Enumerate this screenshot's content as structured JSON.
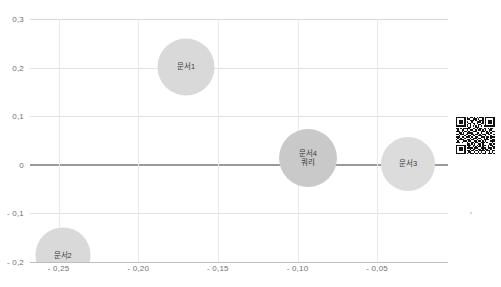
{
  "chart_data": {
    "type": "scatter",
    "title": "",
    "subtitle": "",
    "xlabel": "",
    "ylabel": "",
    "xlim": [
      -0.268,
      -0.0055
    ],
    "ylim": [
      -0.2,
      0.3
    ],
    "grid": true,
    "legend": "none",
    "decimal_separator": ",",
    "x_ticks": [
      {
        "value": -0.25,
        "label": "- 0,25"
      },
      {
        "value": -0.2,
        "label": "- 0,20"
      },
      {
        "value": -0.15,
        "label": "- 0,15"
      },
      {
        "value": -0.1,
        "label": "- 0,10"
      },
      {
        "value": -0.05,
        "label": "- 0,05"
      }
    ],
    "y_ticks": [
      {
        "value": 0.3,
        "label": "0,3"
      },
      {
        "value": 0.2,
        "label": "0,2"
      },
      {
        "value": 0.1,
        "label": "0,1"
      },
      {
        "value": 0.0,
        "label": "0"
      },
      {
        "value": -0.1,
        "label": "- 0,1"
      },
      {
        "value": -0.2,
        "label": "- 0,2"
      }
    ],
    "points": [
      {
        "label": "문서1",
        "label_lines": [
          "문서1"
        ],
        "x": -0.17,
        "y": 0.202,
        "size_px": 57,
        "color": "#d9d9d9"
      },
      {
        "label": "문서2",
        "label_lines": [
          "문서2"
        ],
        "x": -0.2475,
        "y": -0.185,
        "size_px": 55,
        "color": "#d9d9d9"
      },
      {
        "label": "문서4 쿼리",
        "label_lines": [
          "문서4",
          "쿼리"
        ],
        "x": -0.0935,
        "y": 0.014,
        "size_px": 58,
        "color": "#c9c9c9"
      },
      {
        "label": "문서3",
        "label_lines": [
          "문서3"
        ],
        "x": -0.0305,
        "y": 0.0015,
        "size_px": 54,
        "color": "#dcdcdc"
      }
    ]
  },
  "colors": {
    "background": "#ffffff",
    "grid": "#e3e3e3",
    "zero_axis": "#9a9a9a",
    "tick_text": "#6f6f6f",
    "bubble_text": "#3d3d3d"
  },
  "overlay": {
    "qr_code_name": "qr-code"
  }
}
